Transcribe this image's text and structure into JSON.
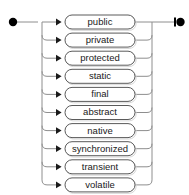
{
  "diagram": {
    "type": "railroad-syntax-diagram",
    "start_terminal": "start-node",
    "end_terminal": "end-node",
    "structure": "choice",
    "colors": {
      "background": "#ffffff",
      "rail": "#8e8e8e",
      "box_outline": "#5a5a5a",
      "box_fill": "#ffffff",
      "text": "#1a1a1a",
      "terminal": "#000000",
      "shadow": "#d8d8d8"
    },
    "layout": {
      "width": 189,
      "height": 195,
      "first_row_center_y": 22,
      "row_spacing": 18.1,
      "left_rail_x": 42,
      "right_rail_x": 152,
      "box_left_x": 65,
      "box_right_x": 135,
      "box_height": 14,
      "arrow_x": 60,
      "start_dot_x": 13,
      "end_dot_x": 181
    },
    "alternatives": [
      {
        "label": "public"
      },
      {
        "label": "private"
      },
      {
        "label": "protected"
      },
      {
        "label": "static"
      },
      {
        "label": "final"
      },
      {
        "label": "abstract"
      },
      {
        "label": "native"
      },
      {
        "label": "synchronized"
      },
      {
        "label": "transient"
      },
      {
        "label": "volatile"
      }
    ]
  }
}
